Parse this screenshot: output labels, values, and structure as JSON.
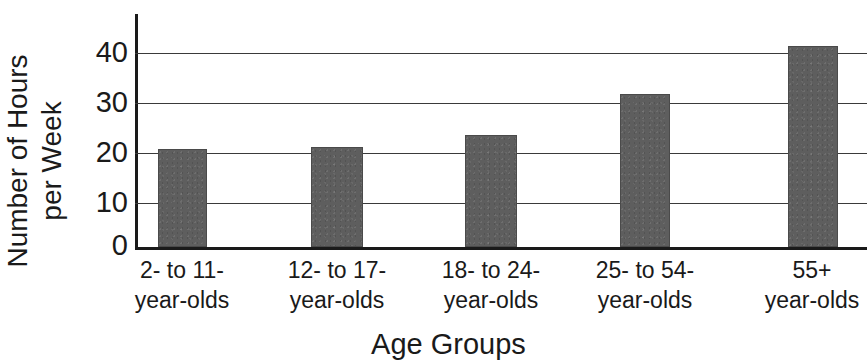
{
  "chart_data": {
    "type": "bar",
    "title": "",
    "xlabel": "Age Groups",
    "ylabel": "Number of Hours per Week",
    "categories": [
      "2- to 11-year-olds",
      "12- to 17-year-olds",
      "18- to 24-year-olds",
      "25- to 54-year-olds",
      "55+ year-olds"
    ],
    "values": [
      20.2,
      20.7,
      23.0,
      31.5,
      41.5
    ],
    "ylim": [
      0,
      46
    ],
    "yticks": [
      0,
      10,
      20,
      30,
      40
    ],
    "grid": "horizontal",
    "legend": "none",
    "bar_color": "#5e5e5e"
  },
  "axes": {
    "y_title_line1": "Number of Hours",
    "y_title_line2": "per Week",
    "x_title": "Age Groups",
    "y_tick_labels": [
      "40",
      "30",
      "20",
      "10",
      "0"
    ]
  },
  "categories_wrapped": [
    {
      "line1": "2- to 11-",
      "line2": "year-olds"
    },
    {
      "line1": "12- to 17-",
      "line2": "year-olds"
    },
    {
      "line1": "18- to 24-",
      "line2": "year-olds"
    },
    {
      "line1": "25- to 54-",
      "line2": "year-olds"
    },
    {
      "line1": "55+",
      "line2": "year-olds"
    }
  ],
  "title_remnant": ""
}
